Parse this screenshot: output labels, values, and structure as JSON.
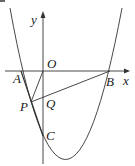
{
  "diagram": {
    "type": "coordinate-geometry",
    "axes": {
      "x_label": "x",
      "y_label": "y",
      "origin_label": "O"
    },
    "points": [
      {
        "label": "A",
        "desc": "left x-intercept of parabola"
      },
      {
        "label": "B",
        "desc": "right x-intercept of parabola"
      },
      {
        "label": "C",
        "desc": "y-intercept of parabola"
      },
      {
        "label": "P",
        "desc": "point on parabola between A and C"
      },
      {
        "label": "Q",
        "desc": "intersection of PB with y-axis"
      }
    ],
    "segments": [
      "PO",
      "PB",
      "AC"
    ],
    "curve": "upward-opening parabola through A, B, C"
  },
  "labels": {
    "y": "y",
    "o": "O",
    "x": "x",
    "a": "A",
    "b": "B",
    "p": "P",
    "q": "Q",
    "c": "C"
  }
}
